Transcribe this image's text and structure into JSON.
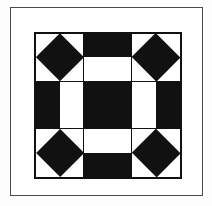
{
  "figure": {
    "kind": "quilt-block-diagram",
    "rendering": "black-and-white line art",
    "frame": {
      "border_color": "#4a4a4a",
      "background_color": "#ffffff"
    },
    "block": {
      "grid_rows": 3,
      "grid_columns": 3,
      "patch_color_dark": "#111111",
      "patch_color_light": "#ffffff",
      "outline_color": "#111111"
    }
  },
  "patches": [
    {
      "position": "top-left",
      "row": 1,
      "column": 1,
      "unit": "square-in-a-square",
      "shape": "diamond",
      "fill": "dark",
      "background": "light"
    },
    {
      "position": "top-center",
      "row": 1,
      "column": 2,
      "unit": "half-square-rectangle",
      "shape": "half-top",
      "fill": "dark",
      "background": "light"
    },
    {
      "position": "top-right",
      "row": 1,
      "column": 3,
      "unit": "square-in-a-square",
      "shape": "diamond",
      "fill": "dark",
      "background": "light"
    },
    {
      "position": "middle-left",
      "row": 2,
      "column": 1,
      "unit": "half-square-rectangle",
      "shape": "half-left",
      "fill": "dark",
      "background": "light"
    },
    {
      "position": "center",
      "row": 2,
      "column": 2,
      "unit": "solid-square",
      "shape": "solid",
      "fill": "dark",
      "background": "dark"
    },
    {
      "position": "middle-right",
      "row": 2,
      "column": 3,
      "unit": "half-square-rectangle",
      "shape": "half-right",
      "fill": "dark",
      "background": "light"
    },
    {
      "position": "bottom-left",
      "row": 3,
      "column": 1,
      "unit": "square-in-a-square",
      "shape": "diamond",
      "fill": "dark",
      "background": "light"
    },
    {
      "position": "bottom-center",
      "row": 3,
      "column": 2,
      "unit": "half-square-rectangle",
      "shape": "half-bottom",
      "fill": "dark",
      "background": "light"
    },
    {
      "position": "bottom-right",
      "row": 3,
      "column": 3,
      "unit": "square-in-a-square",
      "shape": "diamond",
      "fill": "dark",
      "background": "light"
    }
  ]
}
